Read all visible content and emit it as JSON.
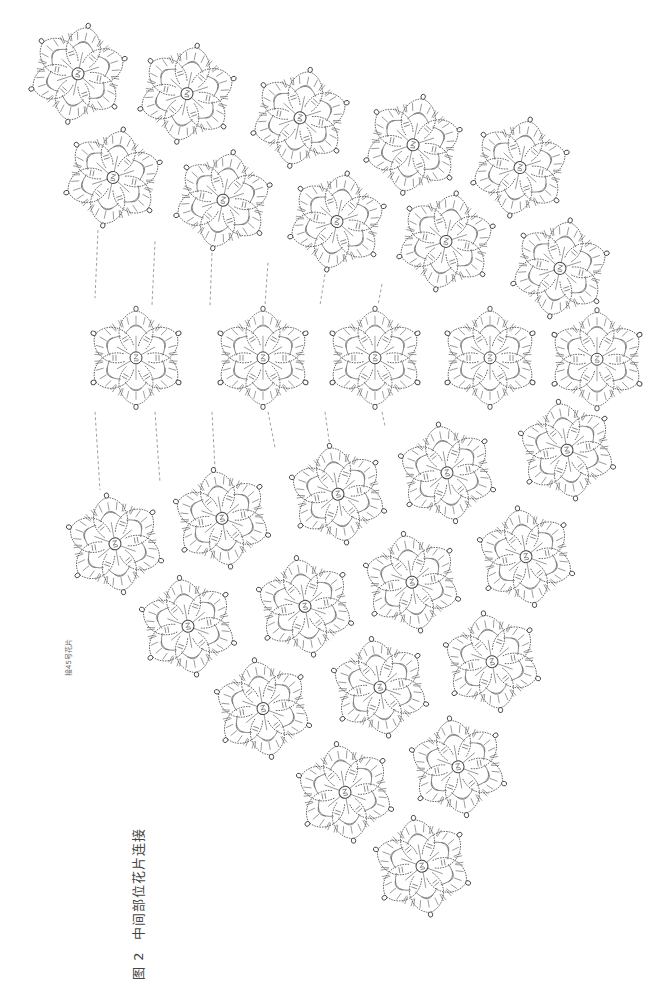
{
  "caption": {
    "figure_number": "图 2",
    "title": "中间部位花片连接"
  },
  "note": {
    "text": "接45号花片"
  },
  "colors": {
    "background": "#ffffff",
    "line": "#555555",
    "text": "#444444"
  },
  "motif": {
    "type": "six-petal crochet flower",
    "petals": 6,
    "radius": 50,
    "center_symbol": "magic-ring"
  },
  "groups": [
    {
      "name": "upper-band",
      "rotation": 12,
      "motifs": [
        {
          "x": 78,
          "y": 52
        },
        {
          "x": 187,
          "y": 66
        },
        {
          "x": 300,
          "y": 83
        },
        {
          "x": 413,
          "y": 102
        },
        {
          "x": 520,
          "y": 118
        },
        {
          "x": 113,
          "y": 125
        },
        {
          "x": 223,
          "y": 141
        },
        {
          "x": 337,
          "y": 156
        },
        {
          "x": 446,
          "y": 170
        },
        {
          "x": 560,
          "y": 189
        }
      ]
    },
    {
      "name": "middle-row",
      "rotation": 0,
      "motifs": [
        {
          "x": 136,
          "y": 252
        },
        {
          "x": 263,
          "y": 252
        },
        {
          "x": 375,
          "y": 252
        },
        {
          "x": 490,
          "y": 252
        },
        {
          "x": 597,
          "y": 253
        }
      ]
    },
    {
      "name": "lower-triangle",
      "rotation": -10,
      "motifs": [
        {
          "x": 115,
          "y": 383
        },
        {
          "x": 222,
          "y": 365
        },
        {
          "x": 338,
          "y": 348
        },
        {
          "x": 447,
          "y": 333
        },
        {
          "x": 567,
          "y": 317
        },
        {
          "x": 188,
          "y": 441
        },
        {
          "x": 305,
          "y": 427
        },
        {
          "x": 412,
          "y": 410
        },
        {
          "x": 526,
          "y": 392
        },
        {
          "x": 263,
          "y": 499
        },
        {
          "x": 380,
          "y": 484
        },
        {
          "x": 492,
          "y": 466
        },
        {
          "x": 345,
          "y": 558
        },
        {
          "x": 458,
          "y": 540
        },
        {
          "x": 422,
          "y": 610
        }
      ]
    }
  ],
  "join_lines": [
    [
      [
        98,
        162
      ],
      [
        95,
        210
      ]
    ],
    [
      [
        155,
        170
      ],
      [
        152,
        215
      ]
    ],
    [
      [
        212,
        178
      ],
      [
        210,
        215
      ]
    ],
    [
      [
        268,
        185
      ],
      [
        265,
        215
      ]
    ],
    [
      [
        325,
        193
      ],
      [
        320,
        215
      ]
    ],
    [
      [
        382,
        200
      ],
      [
        378,
        215
      ]
    ],
    [
      [
        95,
        290
      ],
      [
        100,
        345
      ]
    ],
    [
      [
        155,
        290
      ],
      [
        160,
        340
      ]
    ],
    [
      [
        212,
        290
      ],
      [
        215,
        330
      ]
    ],
    [
      [
        268,
        290
      ],
      [
        275,
        315
      ]
    ],
    [
      [
        325,
        290
      ],
      [
        330,
        315
      ]
    ],
    [
      [
        382,
        290
      ],
      [
        385,
        300
      ]
    ]
  ],
  "layout_scale": {
    "view_width": 655,
    "view_height": 999,
    "diagram_width": 655,
    "diagram_height": 700,
    "diagram_offset_y": 0,
    "scale_y": 1.42
  }
}
